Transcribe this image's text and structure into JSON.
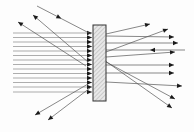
{
  "diagram": {
    "type": "optics-ray-diagram",
    "colors": {
      "line": "#555555",
      "arrow": "#1a1a1a",
      "slab_edge": "#333333",
      "background": "#fdfdfd"
    },
    "slab": {
      "x": 93,
      "y": 25,
      "width": 13,
      "height": 76
    },
    "incident_rays_y": [
      33,
      37.5,
      42,
      46.5,
      51,
      55.5,
      60,
      64.5,
      69,
      73.5,
      78,
      82.5,
      87,
      92
    ],
    "incident_x_start": 13,
    "incident_x_end": 92,
    "incoming_oblique": [
      {
        "x1": 37,
        "y1": 6,
        "x2": 91,
        "y2": 34
      }
    ],
    "reflected_left": [
      {
        "x1": 86,
        "y1": 66,
        "x2": 18,
        "y2": 22
      },
      {
        "x1": 88,
        "y1": 62,
        "x2": 33,
        "y2": 15
      },
      {
        "x1": 88,
        "y1": 84,
        "x2": 35,
        "y2": 115
      },
      {
        "x1": 90,
        "y1": 88,
        "x2": 48,
        "y2": 120
      }
    ],
    "transmitted_right": [
      {
        "x1": 106,
        "y1": 34,
        "x2": 150,
        "y2": 24
      },
      {
        "x1": 106,
        "y1": 52,
        "x2": 168,
        "y2": 29
      },
      {
        "x1": 106,
        "y1": 36,
        "x2": 174,
        "y2": 37
      },
      {
        "x1": 106,
        "y1": 43,
        "x2": 178,
        "y2": 43
      },
      {
        "x1": 106,
        "y1": 57,
        "x2": 175,
        "y2": 52
      },
      {
        "x1": 106,
        "y1": 65,
        "x2": 174,
        "y2": 65
      },
      {
        "x1": 106,
        "y1": 73,
        "x2": 174,
        "y2": 73
      },
      {
        "x1": 106,
        "y1": 82,
        "x2": 182,
        "y2": 86
      },
      {
        "x1": 106,
        "y1": 62,
        "x2": 175,
        "y2": 99
      },
      {
        "x1": 104,
        "y1": 60,
        "x2": 172,
        "y2": 108
      }
    ],
    "counter_ray": {
      "x1": 185,
      "y1": 50,
      "x2": 106,
      "y2": 50,
      "arrow_at": 150
    }
  }
}
